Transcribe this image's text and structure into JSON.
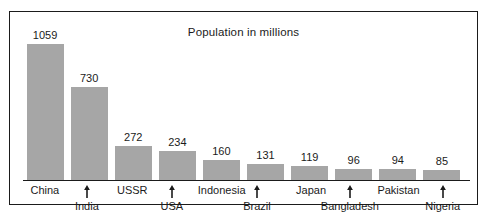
{
  "chart_data": {
    "type": "bar",
    "title": "Population in millions",
    "xlabel": "",
    "ylabel": "",
    "ylim": [
      0,
      1059
    ],
    "grid": false,
    "legend": "none",
    "categories": [
      "China",
      "India",
      "USSR",
      "USA",
      "Indonesia",
      "Brazil",
      "Japan",
      "Bangladesh",
      "Pakistan",
      "Nigeria"
    ],
    "values": [
      1059,
      730,
      272,
      234,
      160,
      131,
      119,
      96,
      94,
      85
    ],
    "value_labels": [
      "1059",
      "730",
      "272",
      "234",
      "160",
      "131",
      "119",
      "96",
      "94",
      "85"
    ],
    "label_rows": [
      "top",
      "bottom",
      "top",
      "bottom",
      "top",
      "bottom",
      "top",
      "bottom",
      "top",
      "bottom"
    ],
    "tick_marker": "up-arrow",
    "bar_color": "#a6a6a6",
    "axis_color": "#1b1b1b",
    "background_color": "#ffffff"
  },
  "frame": {
    "border_color": "#1b1b1b"
  }
}
